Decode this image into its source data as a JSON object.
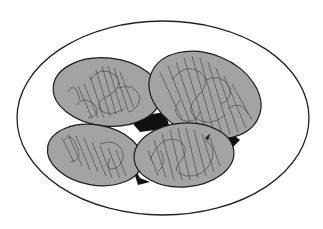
{
  "figure": {
    "background": "#ffffff",
    "plate": {
      "cx": 163,
      "cy": 118,
      "rx": 146,
      "ry": 97,
      "fill": "#ffffff",
      "stroke": "#222222"
    },
    "shadow_color": "#111111",
    "item_fill": "#a3a3a3",
    "item_stroke": "#1a1a1a",
    "scribble_color": "#3a3a3a",
    "items": [
      {
        "name": "top-left",
        "cx": 107,
        "cy": 92,
        "rx": 54,
        "ry": 34,
        "rotate": 6
      },
      {
        "name": "top-right",
        "cx": 205,
        "cy": 95,
        "rx": 58,
        "ry": 41,
        "rotate": 22
      },
      {
        "name": "bottom-left",
        "cx": 95,
        "cy": 155,
        "rx": 48,
        "ry": 30,
        "rotate": 10
      },
      {
        "name": "bottom-right",
        "cx": 184,
        "cy": 155,
        "rx": 50,
        "ry": 32,
        "rotate": -4
      }
    ]
  }
}
